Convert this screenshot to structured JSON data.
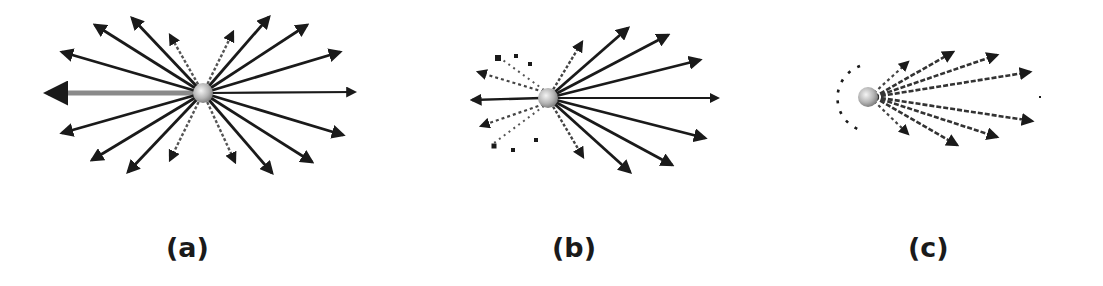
{
  "figure": {
    "panels": [
      {
        "id": "a",
        "label": "(a)",
        "description": "isotropic radiation — symmetric arrows in all directions",
        "rays": [
          {
            "direction": "left",
            "style": "gray-thick"
          },
          {
            "direction": "right",
            "style": "solid"
          },
          {
            "direction": "upper-left-1",
            "style": "solid"
          },
          {
            "direction": "upper-left-2",
            "style": "solid"
          },
          {
            "direction": "upper-left-3",
            "style": "solid"
          },
          {
            "direction": "upper-left-4",
            "style": "dashed"
          },
          {
            "direction": "upper-right-1",
            "style": "dashed"
          },
          {
            "direction": "upper-right-2",
            "style": "solid"
          },
          {
            "direction": "upper-right-3",
            "style": "solid"
          },
          {
            "direction": "upper-right-4",
            "style": "solid"
          },
          {
            "direction": "lower-left-1",
            "style": "solid"
          },
          {
            "direction": "lower-left-2",
            "style": "solid"
          },
          {
            "direction": "lower-left-3",
            "style": "solid"
          },
          {
            "direction": "lower-left-4",
            "style": "dashed"
          },
          {
            "direction": "lower-right-1",
            "style": "dashed"
          },
          {
            "direction": "lower-right-2",
            "style": "solid"
          },
          {
            "direction": "lower-right-3",
            "style": "solid"
          },
          {
            "direction": "lower-right-4",
            "style": "solid"
          }
        ]
      },
      {
        "id": "b",
        "label": "(b)",
        "description": "partially beamed radiation — weaker dotted rays backward",
        "rays": []
      },
      {
        "id": "c",
        "label": "(c)",
        "description": "strongly beamed radiation — forward cone with dashed backward arc",
        "rays": []
      }
    ],
    "colors": {
      "ray": "#1a1a1a",
      "ray_gray": "#8a8a8a",
      "sphere_light": "#f4f4f4",
      "sphere_dark": "#8c8c8c",
      "label": "#1a1a1a"
    }
  }
}
